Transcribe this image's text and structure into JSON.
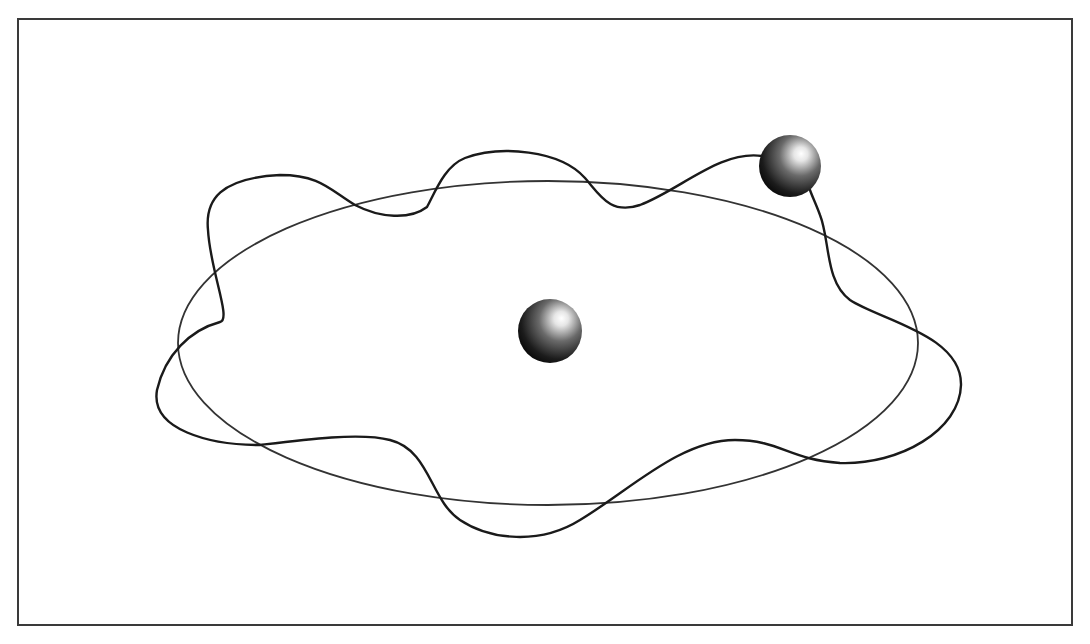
{
  "diagram": {
    "frame": {
      "x": 18,
      "y": 19,
      "width": 1052,
      "height": 604,
      "stroke": "#3a3a3a"
    },
    "ellipse_orbit": {
      "cx": 548,
      "cy": 343,
      "rx": 370,
      "ry": 162,
      "stroke": "#333333"
    },
    "central_body": {
      "cx": 550,
      "cy": 331,
      "r": 32
    },
    "orbiting_body": {
      "cx": 790,
      "cy": 166,
      "r": 31
    },
    "colors": {
      "sphere_dark": "#111111",
      "sphere_mid": "#555555",
      "sphere_highlight": "#ffffff",
      "line": "#1a1a1a",
      "background": "#ffffff"
    }
  }
}
